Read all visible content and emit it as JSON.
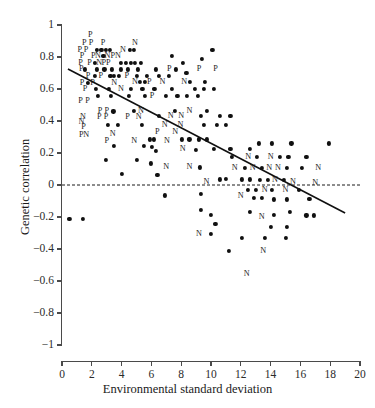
{
  "chart_data": {
    "type": "scatter",
    "title": "",
    "xlabel": "Environmental standard deviation",
    "ylabel": "Genetic correlation",
    "xlim": [
      0,
      20
    ],
    "ylim": [
      -1,
      1
    ],
    "xticks": [
      0,
      2,
      4,
      6,
      8,
      10,
      12,
      14,
      16,
      18,
      20
    ],
    "xtick_labels": [
      "0",
      "2",
      "4",
      "6",
      "8",
      "10",
      "12",
      "14",
      "16",
      "18",
      "20"
    ],
    "yticks": [
      -1,
      -0.8,
      -0.6,
      -0.4,
      -0.2,
      0,
      0.2,
      0.4,
      0.6,
      0.8,
      1
    ],
    "ytick_labels": [
      "−1",
      "−0.8",
      "−0.6",
      "−0.4",
      "−0.2",
      "0",
      "0.2",
      "0.4",
      "0.6",
      "0.8",
      "1"
    ],
    "grid": false,
    "legend": "none",
    "reference_line": {
      "type": "dashed-horizontal",
      "y": 0,
      "color": "#1a1a1a"
    },
    "trend_line": {
      "type": "solid-linear",
      "x0": 0.4,
      "y0": 0.725,
      "x1": 19.0,
      "y1": -0.175,
      "color": "#101010"
    },
    "marker_styles": {
      "dot": "filled-circle",
      "P": "letter-P",
      "N": "letter-N"
    },
    "points": [
      {
        "x": 1.9,
        "y": 0.94,
        "m": "P"
      },
      {
        "x": 1.5,
        "y": 0.885,
        "m": "P"
      },
      {
        "x": 1.95,
        "y": 0.885,
        "m": "P"
      },
      {
        "x": 2.75,
        "y": 0.885,
        "m": "P"
      },
      {
        "x": 4.9,
        "y": 0.885,
        "m": "N"
      },
      {
        "x": 1.2,
        "y": 0.845,
        "m": "P"
      },
      {
        "x": 1.62,
        "y": 0.845,
        "m": "P"
      },
      {
        "x": 2.35,
        "y": 0.845,
        "m": "dot"
      },
      {
        "x": 2.65,
        "y": 0.845,
        "m": "dot"
      },
      {
        "x": 2.95,
        "y": 0.845,
        "m": "dot"
      },
      {
        "x": 3.2,
        "y": 0.845,
        "m": "dot"
      },
      {
        "x": 4.1,
        "y": 0.845,
        "m": "N"
      },
      {
        "x": 4.55,
        "y": 0.845,
        "m": "dot"
      },
      {
        "x": 4.85,
        "y": 0.845,
        "m": "dot"
      },
      {
        "x": 1.35,
        "y": 0.805,
        "m": "P"
      },
      {
        "x": 2.1,
        "y": 0.805,
        "m": "P"
      },
      {
        "x": 2.42,
        "y": 0.805,
        "m": "N"
      },
      {
        "x": 2.78,
        "y": 0.805,
        "m": "dot"
      },
      {
        "x": 3.05,
        "y": 0.805,
        "m": "N"
      },
      {
        "x": 3.4,
        "y": 0.805,
        "m": "P"
      },
      {
        "x": 3.75,
        "y": 0.805,
        "m": "N"
      },
      {
        "x": 7.4,
        "y": 0.805,
        "m": "dot"
      },
      {
        "x": 10.1,
        "y": 0.845,
        "m": "dot"
      },
      {
        "x": 1.25,
        "y": 0.765,
        "m": "P"
      },
      {
        "x": 1.85,
        "y": 0.765,
        "m": "P"
      },
      {
        "x": 2.2,
        "y": 0.765,
        "m": "dot"
      },
      {
        "x": 2.5,
        "y": 0.765,
        "m": "N"
      },
      {
        "x": 2.8,
        "y": 0.765,
        "m": "P"
      },
      {
        "x": 3.1,
        "y": 0.765,
        "m": "P"
      },
      {
        "x": 3.95,
        "y": 0.765,
        "m": "dot"
      },
      {
        "x": 4.3,
        "y": 0.765,
        "m": "dot"
      },
      {
        "x": 4.6,
        "y": 0.765,
        "m": "dot"
      },
      {
        "x": 4.9,
        "y": 0.765,
        "m": "dot"
      },
      {
        "x": 5.3,
        "y": 0.765,
        "m": "dot"
      },
      {
        "x": 8.1,
        "y": 0.765,
        "m": "dot"
      },
      {
        "x": 9.4,
        "y": 0.79,
        "m": "dot"
      },
      {
        "x": 1.3,
        "y": 0.722,
        "m": "P"
      },
      {
        "x": 1.55,
        "y": 0.722,
        "m": "dot"
      },
      {
        "x": 2.35,
        "y": 0.722,
        "m": "dot"
      },
      {
        "x": 2.85,
        "y": 0.722,
        "m": "dot"
      },
      {
        "x": 3.35,
        "y": 0.722,
        "m": "dot"
      },
      {
        "x": 3.95,
        "y": 0.722,
        "m": "dot"
      },
      {
        "x": 4.45,
        "y": 0.722,
        "m": "dot"
      },
      {
        "x": 5.1,
        "y": 0.722,
        "m": "dot"
      },
      {
        "x": 6.3,
        "y": 0.722,
        "m": "dot"
      },
      {
        "x": 7.2,
        "y": 0.722,
        "m": "P"
      },
      {
        "x": 7.65,
        "y": 0.722,
        "m": "dot"
      },
      {
        "x": 9.2,
        "y": 0.722,
        "m": "P"
      },
      {
        "x": 10.3,
        "y": 0.722,
        "m": "P"
      },
      {
        "x": 1.75,
        "y": 0.682,
        "m": "P"
      },
      {
        "x": 2.2,
        "y": 0.682,
        "m": "dot"
      },
      {
        "x": 2.6,
        "y": 0.682,
        "m": "P"
      },
      {
        "x": 3.25,
        "y": 0.682,
        "m": "dot"
      },
      {
        "x": 3.5,
        "y": 0.682,
        "m": "dot"
      },
      {
        "x": 3.8,
        "y": 0.682,
        "m": "dot"
      },
      {
        "x": 4.35,
        "y": 0.682,
        "m": "P"
      },
      {
        "x": 5.0,
        "y": 0.682,
        "m": "dot"
      },
      {
        "x": 5.7,
        "y": 0.682,
        "m": "dot"
      },
      {
        "x": 6.5,
        "y": 0.682,
        "m": "dot"
      },
      {
        "x": 7.15,
        "y": 0.682,
        "m": "dot"
      },
      {
        "x": 8.35,
        "y": 0.7,
        "m": "dot"
      },
      {
        "x": 1.35,
        "y": 0.64,
        "m": "P"
      },
      {
        "x": 1.75,
        "y": 0.64,
        "m": "dot"
      },
      {
        "x": 2.05,
        "y": 0.64,
        "m": "P"
      },
      {
        "x": 3.5,
        "y": 0.64,
        "m": "N"
      },
      {
        "x": 4.9,
        "y": 0.645,
        "m": "N"
      },
      {
        "x": 5.25,
        "y": 0.645,
        "m": "dot"
      },
      {
        "x": 5.55,
        "y": 0.645,
        "m": "dot"
      },
      {
        "x": 5.85,
        "y": 0.645,
        "m": "P"
      },
      {
        "x": 6.75,
        "y": 0.645,
        "m": "N"
      },
      {
        "x": 8.2,
        "y": 0.645,
        "m": "N"
      },
      {
        "x": 8.6,
        "y": 0.645,
        "m": "dot"
      },
      {
        "x": 9.6,
        "y": 0.645,
        "m": "dot"
      },
      {
        "x": 1.55,
        "y": 0.6,
        "m": "P"
      },
      {
        "x": 2.3,
        "y": 0.6,
        "m": "dot"
      },
      {
        "x": 3.15,
        "y": 0.6,
        "m": "dot"
      },
      {
        "x": 3.95,
        "y": 0.6,
        "m": "N"
      },
      {
        "x": 4.6,
        "y": 0.6,
        "m": "dot"
      },
      {
        "x": 5.4,
        "y": 0.6,
        "m": "dot"
      },
      {
        "x": 6.2,
        "y": 0.6,
        "m": "dot"
      },
      {
        "x": 7.35,
        "y": 0.6,
        "m": "dot"
      },
      {
        "x": 8.9,
        "y": 0.6,
        "m": "dot"
      },
      {
        "x": 9.5,
        "y": 0.6,
        "m": "dot"
      },
      {
        "x": 10.2,
        "y": 0.6,
        "m": "dot"
      },
      {
        "x": 1.25,
        "y": 0.525,
        "m": "P"
      },
      {
        "x": 1.72,
        "y": 0.525,
        "m": "P"
      },
      {
        "x": 2.4,
        "y": 0.555,
        "m": "dot"
      },
      {
        "x": 3.3,
        "y": 0.555,
        "m": "dot"
      },
      {
        "x": 4.5,
        "y": 0.555,
        "m": "dot"
      },
      {
        "x": 5.55,
        "y": 0.555,
        "m": "dot"
      },
      {
        "x": 6.05,
        "y": 0.555,
        "m": "P"
      },
      {
        "x": 7.0,
        "y": 0.555,
        "m": "dot"
      },
      {
        "x": 7.75,
        "y": 0.555,
        "m": "dot"
      },
      {
        "x": 8.4,
        "y": 0.555,
        "m": "dot"
      },
      {
        "x": 9.1,
        "y": 0.555,
        "m": "dot"
      },
      {
        "x": 2.55,
        "y": 0.46,
        "m": "P"
      },
      {
        "x": 3.0,
        "y": 0.46,
        "m": "P"
      },
      {
        "x": 3.45,
        "y": 0.46,
        "m": "dot"
      },
      {
        "x": 4.85,
        "y": 0.465,
        "m": "dot"
      },
      {
        "x": 5.3,
        "y": 0.465,
        "m": "N"
      },
      {
        "x": 7.6,
        "y": 0.465,
        "m": "dot"
      },
      {
        "x": 8.55,
        "y": 0.465,
        "m": "N"
      },
      {
        "x": 9.7,
        "y": 0.465,
        "m": "dot"
      },
      {
        "x": 1.4,
        "y": 0.425,
        "m": "N"
      },
      {
        "x": 2.5,
        "y": 0.425,
        "m": "P"
      },
      {
        "x": 2.95,
        "y": 0.425,
        "m": "P"
      },
      {
        "x": 4.4,
        "y": 0.425,
        "m": "P"
      },
      {
        "x": 5.15,
        "y": 0.425,
        "m": "N"
      },
      {
        "x": 6.5,
        "y": 0.43,
        "m": "dot"
      },
      {
        "x": 7.3,
        "y": 0.43,
        "m": "N"
      },
      {
        "x": 8.0,
        "y": 0.43,
        "m": "N"
      },
      {
        "x": 9.3,
        "y": 0.43,
        "m": "dot"
      },
      {
        "x": 10.6,
        "y": 0.43,
        "m": "dot"
      },
      {
        "x": 11.3,
        "y": 0.43,
        "m": "dot"
      },
      {
        "x": 1.3,
        "y": 0.395,
        "m": "N"
      },
      {
        "x": 1.45,
        "y": 0.365,
        "m": "P"
      },
      {
        "x": 3.1,
        "y": 0.375,
        "m": "dot"
      },
      {
        "x": 3.75,
        "y": 0.375,
        "m": "dot"
      },
      {
        "x": 5.35,
        "y": 0.375,
        "m": "dot"
      },
      {
        "x": 6.9,
        "y": 0.375,
        "m": "N"
      },
      {
        "x": 7.95,
        "y": 0.375,
        "m": "N"
      },
      {
        "x": 9.5,
        "y": 0.375,
        "m": "dot"
      },
      {
        "x": 10.4,
        "y": 0.375,
        "m": "dot"
      },
      {
        "x": 11.0,
        "y": 0.375,
        "m": "dot"
      },
      {
        "x": 1.3,
        "y": 0.315,
        "m": "P"
      },
      {
        "x": 1.62,
        "y": 0.315,
        "m": "N"
      },
      {
        "x": 3.4,
        "y": 0.32,
        "m": "N"
      },
      {
        "x": 6.4,
        "y": 0.33,
        "m": "P"
      },
      {
        "x": 7.6,
        "y": 0.33,
        "m": "N"
      },
      {
        "x": 5.9,
        "y": 0.285,
        "m": "dot"
      },
      {
        "x": 6.15,
        "y": 0.285,
        "m": "dot"
      },
      {
        "x": 8.05,
        "y": 0.285,
        "m": "dot"
      },
      {
        "x": 8.55,
        "y": 0.285,
        "m": "dot"
      },
      {
        "x": 9.2,
        "y": 0.285,
        "m": "dot"
      },
      {
        "x": 9.7,
        "y": 0.285,
        "m": "dot"
      },
      {
        "x": 3.0,
        "y": 0.275,
        "m": "P"
      },
      {
        "x": 4.85,
        "y": 0.275,
        "m": "N"
      },
      {
        "x": 7.05,
        "y": 0.275,
        "m": "N"
      },
      {
        "x": 3.5,
        "y": 0.245,
        "m": "dot"
      },
      {
        "x": 5.5,
        "y": 0.245,
        "m": "dot"
      },
      {
        "x": 6.05,
        "y": 0.24,
        "m": "dot"
      },
      {
        "x": 6.3,
        "y": 0.215,
        "m": "dot"
      },
      {
        "x": 8.1,
        "y": 0.225,
        "m": "N"
      },
      {
        "x": 9.0,
        "y": 0.22,
        "m": "dot"
      },
      {
        "x": 2.95,
        "y": 0.155,
        "m": "dot"
      },
      {
        "x": 5.0,
        "y": 0.155,
        "m": "dot"
      },
      {
        "x": 5.95,
        "y": 0.135,
        "m": "dot"
      },
      {
        "x": 7.0,
        "y": 0.11,
        "m": "N"
      },
      {
        "x": 8.55,
        "y": 0.11,
        "m": "N"
      },
      {
        "x": 9.25,
        "y": 0.11,
        "m": "dot"
      },
      {
        "x": 4.0,
        "y": 0.07,
        "m": "dot"
      },
      {
        "x": 6.4,
        "y": 0.065,
        "m": "dot"
      },
      {
        "x": 10.2,
        "y": 0.225,
        "m": "dot"
      },
      {
        "x": 11.3,
        "y": 0.225,
        "m": "dot"
      },
      {
        "x": 12.6,
        "y": 0.225,
        "m": "dot"
      },
      {
        "x": 13.2,
        "y": 0.26,
        "m": "dot"
      },
      {
        "x": 14.1,
        "y": 0.26,
        "m": "dot"
      },
      {
        "x": 15.4,
        "y": 0.26,
        "m": "dot"
      },
      {
        "x": 17.9,
        "y": 0.26,
        "m": "dot"
      },
      {
        "x": 11.4,
        "y": 0.175,
        "m": "dot"
      },
      {
        "x": 12.5,
        "y": 0.175,
        "m": "N"
      },
      {
        "x": 13.1,
        "y": 0.175,
        "m": "dot"
      },
      {
        "x": 14.0,
        "y": 0.175,
        "m": "N"
      },
      {
        "x": 14.6,
        "y": 0.175,
        "m": "dot"
      },
      {
        "x": 15.2,
        "y": 0.175,
        "m": "dot"
      },
      {
        "x": 16.4,
        "y": 0.175,
        "m": "dot"
      },
      {
        "x": 11.6,
        "y": 0.105,
        "m": "N"
      },
      {
        "x": 12.3,
        "y": 0.105,
        "m": "dot"
      },
      {
        "x": 12.8,
        "y": 0.105,
        "m": "N"
      },
      {
        "x": 13.4,
        "y": 0.105,
        "m": "dot"
      },
      {
        "x": 13.9,
        "y": 0.105,
        "m": "N"
      },
      {
        "x": 14.5,
        "y": 0.105,
        "m": "N"
      },
      {
        "x": 15.1,
        "y": 0.105,
        "m": "dot"
      },
      {
        "x": 16.1,
        "y": 0.105,
        "m": "dot"
      },
      {
        "x": 17.2,
        "y": 0.105,
        "m": "N"
      },
      {
        "x": 11.0,
        "y": 0.04,
        "m": "dot"
      },
      {
        "x": 12.1,
        "y": 0.035,
        "m": "dot"
      },
      {
        "x": 12.6,
        "y": 0.035,
        "m": "dot"
      },
      {
        "x": 13.3,
        "y": 0.03,
        "m": "dot"
      },
      {
        "x": 13.8,
        "y": 0.03,
        "m": "dot"
      },
      {
        "x": 14.3,
        "y": 0.03,
        "m": "N"
      },
      {
        "x": 14.9,
        "y": 0.03,
        "m": "dot"
      },
      {
        "x": 15.5,
        "y": 0.02,
        "m": "N"
      },
      {
        "x": 17.0,
        "y": 0.015,
        "m": "N"
      },
      {
        "x": 9.7,
        "y": 0.02,
        "m": "N"
      },
      {
        "x": 10.6,
        "y": 0.035,
        "m": "dot"
      },
      {
        "x": 12.5,
        "y": -0.03,
        "m": "dot"
      },
      {
        "x": 13.0,
        "y": -0.03,
        "m": "dot"
      },
      {
        "x": 13.6,
        "y": -0.03,
        "m": "N"
      },
      {
        "x": 14.1,
        "y": -0.03,
        "m": "dot"
      },
      {
        "x": 15.0,
        "y": -0.03,
        "m": "N"
      },
      {
        "x": 15.9,
        "y": -0.03,
        "m": "dot"
      },
      {
        "x": 6.9,
        "y": -0.065,
        "m": "dot"
      },
      {
        "x": 9.3,
        "y": -0.055,
        "m": "dot"
      },
      {
        "x": 12.0,
        "y": -0.07,
        "m": "N"
      },
      {
        "x": 12.9,
        "y": -0.08,
        "m": "dot"
      },
      {
        "x": 13.4,
        "y": -0.08,
        "m": "dot"
      },
      {
        "x": 14.2,
        "y": -0.09,
        "m": "dot"
      },
      {
        "x": 15.1,
        "y": -0.09,
        "m": "dot"
      },
      {
        "x": 16.6,
        "y": -0.085,
        "m": "dot"
      },
      {
        "x": 0.5,
        "y": -0.21,
        "m": "dot"
      },
      {
        "x": 1.4,
        "y": -0.21,
        "m": "dot"
      },
      {
        "x": 9.3,
        "y": -0.155,
        "m": "dot"
      },
      {
        "x": 10.0,
        "y": -0.185,
        "m": "dot"
      },
      {
        "x": 12.6,
        "y": -0.17,
        "m": "dot"
      },
      {
        "x": 13.4,
        "y": -0.2,
        "m": "N"
      },
      {
        "x": 14.2,
        "y": -0.185,
        "m": "dot"
      },
      {
        "x": 15.3,
        "y": -0.17,
        "m": "dot"
      },
      {
        "x": 16.4,
        "y": -0.19,
        "m": "dot"
      },
      {
        "x": 16.9,
        "y": -0.19,
        "m": "dot"
      },
      {
        "x": 10.3,
        "y": -0.245,
        "m": "dot"
      },
      {
        "x": 14.0,
        "y": -0.26,
        "m": "dot"
      },
      {
        "x": 15.1,
        "y": -0.26,
        "m": "dot"
      },
      {
        "x": 9.2,
        "y": -0.305,
        "m": "N"
      },
      {
        "x": 10.0,
        "y": -0.305,
        "m": "dot"
      },
      {
        "x": 12.1,
        "y": -0.33,
        "m": "dot"
      },
      {
        "x": 13.6,
        "y": -0.33,
        "m": "dot"
      },
      {
        "x": 15.0,
        "y": -0.33,
        "m": "dot"
      },
      {
        "x": 11.2,
        "y": -0.41,
        "m": "dot"
      },
      {
        "x": 13.5,
        "y": -0.41,
        "m": "N"
      },
      {
        "x": 12.4,
        "y": -0.555,
        "m": "N"
      }
    ]
  }
}
